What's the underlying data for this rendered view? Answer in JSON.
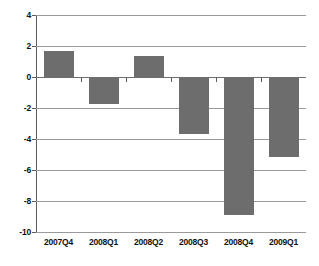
{
  "chart_data": {
    "type": "bar",
    "title": "",
    "subtitle": "",
    "xlabel": "",
    "ylabel": "",
    "categories": [
      "2007Q4",
      "2008Q1",
      "2008Q2",
      "2008Q3",
      "2008Q4",
      "2009Q1"
    ],
    "values": [
      1.7,
      -1.75,
      1.35,
      -3.65,
      -8.9,
      -5.15
    ],
    "series": [
      {
        "name": "",
        "values": [
          1.7,
          -1.75,
          1.35,
          -3.65,
          -8.9,
          -5.15
        ]
      }
    ],
    "ylim": [
      -10,
      4
    ],
    "ytick_values": [
      4,
      2,
      0,
      -2,
      -4,
      -6,
      -8,
      -10
    ],
    "ytick_labels": [
      "4",
      "2",
      "0",
      "-2",
      "-4",
      "-6",
      "-8",
      "-10"
    ],
    "grid": true,
    "grid_axis": "y",
    "legend": false,
    "legend_position": "none",
    "bar_color": "#6d6d6d",
    "gridline_color": "#9a9a9a",
    "axis_color": "#5d5d5d",
    "background_color": "#ffffff",
    "annotations": []
  }
}
